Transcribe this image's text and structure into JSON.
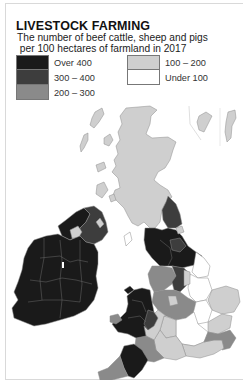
{
  "title": "LIVESTOCK FARMING",
  "subtitle_line1": "The number of beef cattle, sheep and pigs",
  "subtitle_line2": " per 100 hectares of farmland in 2017",
  "legend": {
    "left": [
      {
        "label": "Over 400",
        "color": "#1a1a1a"
      },
      {
        "label": "300 – 400",
        "color": "#3d3d3d"
      },
      {
        "label": "200 – 300",
        "color": "#8a8a8a"
      }
    ],
    "right": [
      {
        "label": "100 – 200",
        "color": "#cfcfcf"
      },
      {
        "label": "Under 100",
        "color": "#ffffff"
      }
    ]
  },
  "colors": {
    "over_400": "#1a1a1a",
    "300_400": "#3d3d3d",
    "200_300": "#8a8a8a",
    "100_200": "#cfcfcf",
    "under_100": "#ffffff",
    "boundary": "#8c8c8c"
  },
  "map": {
    "regions": [
      {
        "name": "Scotland Highlands & Islands",
        "class": "100-200"
      },
      {
        "name": "Southern Scotland",
        "class": "100-200"
      },
      {
        "name": "Shetland & Orkney inset",
        "class": "100-200"
      },
      {
        "name": "Northern Ireland west",
        "class": "over-400"
      },
      {
        "name": "Northern Ireland east",
        "class": "300-400"
      },
      {
        "name": "Lough Neagh area",
        "class": "100-200"
      },
      {
        "name": "Republic of Ireland",
        "class": "over-400"
      },
      {
        "name": "Cumbria / Northumberland",
        "class": "over-400"
      },
      {
        "name": "Northumberland north",
        "class": "300-400"
      },
      {
        "name": "Yorkshire Dales",
        "class": "over-400"
      },
      {
        "name": "East Yorkshire",
        "class": "under-100"
      },
      {
        "name": "Lancashire / Cheshire",
        "class": "200-300"
      },
      {
        "name": "Wales",
        "class": "over-400"
      },
      {
        "name": "Welsh borders",
        "class": "300-400"
      },
      {
        "name": "English Midlands",
        "class": "200-300"
      },
      {
        "name": "Lincolnshire / East Midlands",
        "class": "under-100"
      },
      {
        "name": "East Anglia",
        "class": "100-200"
      },
      {
        "name": "South East England",
        "class": "100-200"
      },
      {
        "name": "Kent / Sussex",
        "class": "200-300"
      },
      {
        "name": "London & Home Counties",
        "class": "under-100"
      },
      {
        "name": "Devon",
        "class": "over-400"
      },
      {
        "name": "Somerset / Dorset",
        "class": "200-300"
      },
      {
        "name": "Cornwall",
        "class": "200-300"
      },
      {
        "name": "Hampshire / Wiltshire",
        "class": "100-200"
      }
    ]
  }
}
